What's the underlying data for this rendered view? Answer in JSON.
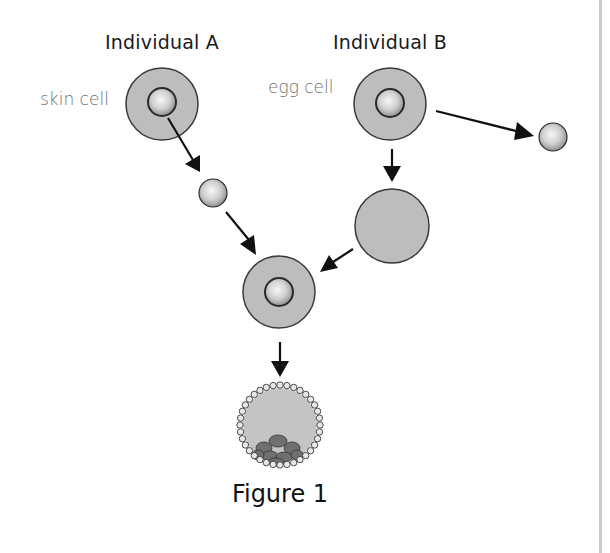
{
  "figure": {
    "caption": "Figure 1",
    "individual_a": {
      "heading": "Individual A",
      "cell_label": "skin cell"
    },
    "individual_b": {
      "heading": "Individual B",
      "cell_label": "egg cell"
    }
  },
  "colors": {
    "cytoplasm": "#bdbdbd",
    "outline": "#3a3a3a",
    "nucleus_light": "#f2f2f2",
    "nucleus_dark": "#8a8a8a",
    "arrow": "#111111",
    "inner_cell_mass": "#6f6f6f",
    "divider": "#c9c9c9"
  },
  "stages": [
    {
      "id": "skin-cell",
      "description": "Skin cell from Individual A with nucleus"
    },
    {
      "id": "donor-nucleus",
      "description": "Nucleus extracted from skin cell"
    },
    {
      "id": "egg-cell",
      "description": "Egg cell from Individual B with nucleus"
    },
    {
      "id": "removed-egg-nucleus",
      "description": "Nucleus removed from egg cell"
    },
    {
      "id": "enucleated-egg",
      "description": "Egg cell without nucleus"
    },
    {
      "id": "reconstructed-cell",
      "description": "Egg cell containing nucleus from skin cell"
    },
    {
      "id": "blastocyst",
      "description": "Early embryo (blastocyst)"
    }
  ]
}
